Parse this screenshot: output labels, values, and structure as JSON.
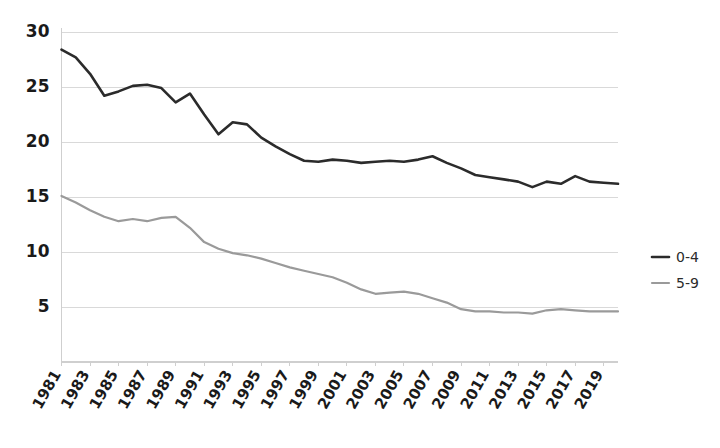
{
  "chart_data": {
    "type": "line",
    "title": "",
    "subtitle": "",
    "xlabel": "",
    "ylabel": "",
    "grid": true,
    "legend_position": "right",
    "xlim": [
      1981,
      2020
    ],
    "ylim": [
      0,
      30
    ],
    "y_ticks": [
      5,
      10,
      15,
      20,
      25,
      30
    ],
    "x_tick_labels": [
      "1981",
      "1983",
      "1985",
      "1987",
      "1989",
      "1991",
      "1993",
      "1995",
      "1997",
      "1999",
      "2001",
      "2003",
      "2005",
      "2007",
      "2009",
      "2011",
      "2013",
      "2015",
      "2017",
      "2019"
    ],
    "x": [
      1981,
      1982,
      1983,
      1984,
      1985,
      1986,
      1987,
      1988,
      1989,
      1990,
      1991,
      1992,
      1993,
      1994,
      1995,
      1996,
      1997,
      1998,
      1999,
      2000,
      2001,
      2002,
      2003,
      2004,
      2005,
      2006,
      2007,
      2008,
      2009,
      2010,
      2011,
      2012,
      2013,
      2014,
      2015,
      2016,
      2017,
      2018,
      2019,
      2020
    ],
    "series": [
      {
        "name": "0-4",
        "color": "#2b2b2b",
        "values": [
          28.4,
          27.7,
          26.2,
          24.2,
          24.6,
          25.1,
          25.2,
          24.9,
          23.6,
          24.4,
          22.5,
          20.7,
          21.8,
          21.6,
          20.4,
          19.6,
          18.9,
          18.3,
          18.2,
          18.4,
          18.3,
          18.1,
          18.2,
          18.3,
          18.2,
          18.4,
          18.7,
          18.1,
          17.6,
          17.0,
          16.8,
          16.6,
          16.4,
          15.9,
          16.4,
          16.2,
          16.9,
          16.4,
          16.3,
          16.2
        ]
      },
      {
        "name": "5-9",
        "color": "#9a9a9a",
        "values": [
          15.1,
          14.5,
          13.8,
          13.2,
          12.8,
          13.0,
          12.8,
          13.1,
          13.2,
          12.2,
          10.9,
          10.3,
          9.9,
          9.7,
          9.4,
          9.0,
          8.6,
          8.3,
          8.0,
          7.7,
          7.2,
          6.6,
          6.2,
          6.3,
          6.4,
          6.2,
          5.8,
          5.4,
          4.8,
          4.6,
          4.6,
          4.5,
          4.5,
          4.4,
          4.7,
          4.8,
          4.7,
          4.6,
          4.6,
          4.6
        ]
      }
    ]
  },
  "legend": {
    "items": [
      {
        "label": "0-4",
        "color": "#2b2b2b"
      },
      {
        "label": "5-9",
        "color": "#9a9a9a"
      }
    ]
  },
  "axis": {
    "y_labels": [
      "30",
      "25",
      "20",
      "15",
      "10",
      "5"
    ],
    "x_labels": [
      "1981",
      "1983",
      "1985",
      "1987",
      "1989",
      "1991",
      "1993",
      "1995",
      "1997",
      "1999",
      "2001",
      "2003",
      "2005",
      "2007",
      "2009",
      "2011",
      "2013",
      "2015",
      "2017",
      "2019"
    ]
  }
}
